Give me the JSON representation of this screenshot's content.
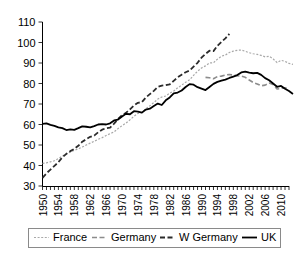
{
  "chart_data": {
    "type": "line",
    "title": "",
    "subtitle": "",
    "xlabel": "",
    "ylabel": "",
    "xlim": [
      1950,
      2012
    ],
    "ylim": [
      30,
      110
    ],
    "ytick_values": [
      30,
      40,
      50,
      60,
      70,
      80,
      90,
      100,
      110
    ],
    "ytick_labels": [
      "30",
      "40",
      "50",
      "60",
      "70",
      "80",
      "90",
      "100",
      "110"
    ],
    "xtick_step": 1,
    "xtick_label_step": 4,
    "xtick_labels": [
      "1950",
      "1954",
      "1958",
      "1962",
      "1966",
      "1970",
      "1974",
      "1978",
      "1982",
      "1986",
      "1990",
      "1994",
      "1998",
      "2002",
      "2006",
      "2010"
    ],
    "grid": false,
    "legend_position": "bottom",
    "series": [
      {
        "name": "France",
        "style": "dotted",
        "color": "#a8a8a8",
        "x_start": 1950,
        "values": [
          41.0,
          41.3,
          41.8,
          42.3,
          43.4,
          44.6,
          45.6,
          46.6,
          47.4,
          48.1,
          49.0,
          50.0,
          50.9,
          51.8,
          52.8,
          53.6,
          54.6,
          55.5,
          56.4,
          58.0,
          59.4,
          60.7,
          62.3,
          64.0,
          65.4,
          65.9,
          67.7,
          69.1,
          70.7,
          72.4,
          73.4,
          73.9,
          75.3,
          76.3,
          77.9,
          79.2,
          80.6,
          81.8,
          84.0,
          86.0,
          87.6,
          88.6,
          90.0,
          90.1,
          91.9,
          93.3,
          93.9,
          95.1,
          95.8,
          96.2,
          96.3,
          95.7,
          95.0,
          94.5,
          94.2,
          93.7,
          93.0,
          93.3,
          92.0,
          90.2,
          91.3,
          90.8,
          89.8,
          89.3
        ]
      },
      {
        "name": "Germany",
        "style": "dashed-gray",
        "color": "#8c8c8c",
        "x_start": 1991,
        "values": [
          83.0,
          82.8,
          82.3,
          83.4,
          83.6,
          84.1,
          84.4,
          84.1,
          83.8,
          83.6,
          83.0,
          81.7,
          80.5,
          79.8,
          78.9,
          79.2,
          80.2,
          79.5,
          77.3,
          77.6,
          77.9,
          77.3
        ]
      },
      {
        "name": "W Germany",
        "style": "dashed-dark",
        "color": "#2b2b2b",
        "x_start": 1950,
        "values": [
          34.0,
          36.2,
          38.0,
          39.8,
          41.6,
          44.0,
          45.7,
          47.0,
          48.1,
          49.6,
          51.6,
          52.8,
          54.0,
          54.6,
          56.2,
          57.5,
          58.2,
          58.5,
          60.4,
          62.7,
          64.5,
          65.7,
          67.4,
          69.3,
          70.6,
          70.9,
          73.2,
          74.8,
          76.4,
          78.3,
          79.0,
          79.2,
          79.6,
          81.3,
          83.0,
          84.3,
          85.5,
          86.3,
          88.2,
          90.1,
          92.6,
          94.4,
          96.0,
          95.8,
          98.4,
          100.3,
          102.0,
          104.2
        ]
      },
      {
        "name": "UK",
        "style": "solid",
        "color": "#000000",
        "x_start": 1950,
        "values": [
          60.3,
          60.5,
          59.8,
          59.3,
          58.6,
          58.2,
          57.3,
          57.6,
          57.4,
          58.2,
          59.1,
          58.9,
          58.6,
          59.2,
          60.0,
          60.2,
          60.0,
          60.6,
          62.0,
          62.4,
          63.9,
          65.2,
          65.0,
          66.5,
          66.3,
          65.8,
          67.3,
          67.7,
          69.0,
          70.2,
          69.5,
          71.8,
          73.2,
          75.2,
          75.6,
          76.6,
          78.3,
          79.7,
          79.4,
          78.2,
          77.5,
          76.8,
          78.3,
          79.8,
          80.8,
          81.4,
          81.9,
          82.7,
          83.4,
          84.1,
          85.4,
          85.8,
          85.3,
          85.0,
          85.2,
          84.2,
          82.6,
          81.6,
          80.0,
          78.4,
          78.8,
          77.4,
          76.3,
          74.9
        ]
      }
    ]
  },
  "legend": {
    "items": [
      {
        "label": "France",
        "style": "dotted",
        "color": "#a8a8a8"
      },
      {
        "label": "Germany",
        "style": "dashed-gray",
        "color": "#8c8c8c"
      },
      {
        "label": "W Germany",
        "style": "dashed-dark",
        "color": "#2b2b2b"
      },
      {
        "label": "UK",
        "style": "solid",
        "color": "#000000"
      }
    ]
  }
}
